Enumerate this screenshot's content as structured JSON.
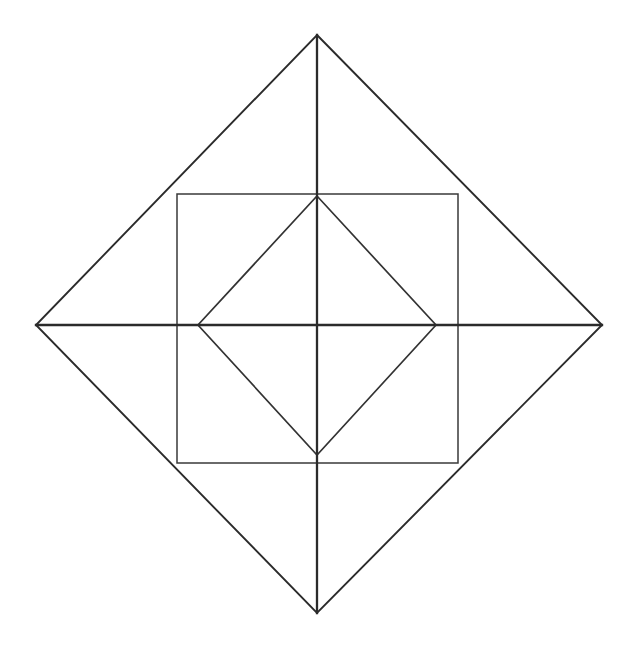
{
  "figure": {
    "background_color": "#ffffff",
    "stroke_color": "#2b2b2b",
    "canvas": {
      "width": 631,
      "height": 651
    },
    "center": {
      "x": 317,
      "y": 325
    },
    "shapes": {
      "outer_diamond": {
        "name": "outer-diamond",
        "type": "rotated-square",
        "points": "317,35 602,325 317,613 36,325",
        "vertices": {
          "top": {
            "x": 317,
            "y": 35
          },
          "right": {
            "x": 602,
            "y": 325
          },
          "bottom": {
            "x": 317,
            "y": 613
          },
          "left": {
            "x": 36,
            "y": 325
          }
        },
        "half_diagonal_horizontal": 283,
        "half_diagonal_vertical": 289
      },
      "middle_square": {
        "name": "middle-square",
        "type": "axis-aligned-square",
        "points": "177,194 458,194 458,463 177,463",
        "bounds": {
          "left": 177,
          "top": 194,
          "right": 458,
          "bottom": 463
        },
        "width": 281,
        "height": 269
      },
      "inner_diamond": {
        "name": "inner-diamond",
        "type": "rotated-square",
        "points": "317,196 436,325 317,455 198,325",
        "vertices": {
          "top": {
            "x": 317,
            "y": 196
          },
          "right": {
            "x": 436,
            "y": 325
          },
          "bottom": {
            "x": 317,
            "y": 455
          },
          "left": {
            "x": 198,
            "y": 325
          }
        },
        "half_diagonal_horizontal": 119,
        "half_diagonal_vertical": 130
      },
      "vertical_axis": {
        "name": "vertical-axis-line",
        "x1": 317,
        "y1": 35,
        "x2": 317,
        "y2": 613
      },
      "horizontal_axis": {
        "name": "horizontal-axis-line",
        "x1": 36,
        "y1": 325,
        "x2": 602,
        "y2": 325
      }
    }
  }
}
